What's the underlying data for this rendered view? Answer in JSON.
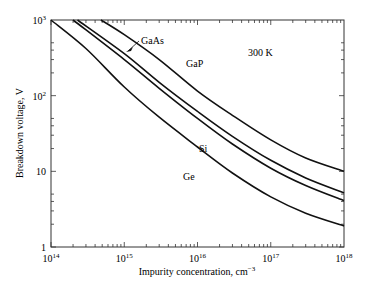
{
  "chart_data": {
    "type": "line",
    "title": "",
    "annotation": "300 K",
    "xlabel": "Impurity concentration, cm",
    "xlabel_unit_sup": "−3",
    "ylabel": "Breakdown voltage, V",
    "xscale": "log",
    "yscale": "log",
    "xlim": [
      100000000000000.0,
      1e+18
    ],
    "ylim": [
      1,
      1000
    ],
    "grid": false,
    "legend": "inline labels",
    "x_ticks": [
      {
        "base": "10",
        "exp": "14",
        "value": 100000000000000.0
      },
      {
        "base": "10",
        "exp": "15",
        "value": 1000000000000000.0
      },
      {
        "base": "10",
        "exp": "16",
        "value": 1e+16
      },
      {
        "base": "10",
        "exp": "17",
        "value": 1e+17
      },
      {
        "base": "10",
        "exp": "18",
        "value": 1e+18
      }
    ],
    "y_ticks": [
      {
        "label": "1",
        "exp": "",
        "value": 1
      },
      {
        "label": "10",
        "exp": "",
        "value": 10
      },
      {
        "label": "10",
        "exp": "2",
        "value": 100
      },
      {
        "label": "10",
        "exp": "3",
        "value": 1000
      }
    ],
    "x": [
      100000000000000.0,
      300000000000000.0,
      1000000000000000.0,
      3000000000000000.0,
      1e+16,
      3e+16,
      1e+17,
      3e+17,
      1e+18
    ],
    "series": [
      {
        "name": "GaP",
        "label_pos": [
          186,
          67
        ],
        "points": [
          [
            480000000000000.0,
            1000
          ],
          [
            1000000000000000.0,
            640
          ],
          [
            3000000000000000.0,
            300
          ],
          [
            1e+16,
            115
          ],
          [
            3e+16,
            55
          ],
          [
            1e+17,
            26
          ],
          [
            3e+17,
            15
          ],
          [
            1e+18,
            10
          ]
        ]
      },
      {
        "name": "GaAs",
        "label_pos": [
          141,
          44
        ],
        "arrow": true,
        "points": [
          [
            230000000000000.0,
            1000
          ],
          [
            1000000000000000.0,
            360
          ],
          [
            3000000000000000.0,
            150
          ],
          [
            1e+16,
            62
          ],
          [
            3e+16,
            29
          ],
          [
            1e+17,
            14
          ],
          [
            3e+17,
            8.2
          ],
          [
            1e+18,
            5.2
          ]
        ]
      },
      {
        "name": "Si",
        "label_pos": [
          199,
          152
        ],
        "points": [
          [
            200000000000000.0,
            1000
          ],
          [
            1000000000000000.0,
            300
          ],
          [
            3000000000000000.0,
            125
          ],
          [
            1e+16,
            50
          ],
          [
            3e+16,
            23
          ],
          [
            1e+17,
            11
          ],
          [
            3e+17,
            6.5
          ],
          [
            1e+18,
            4.1
          ]
        ]
      },
      {
        "name": "Ge",
        "label_pos": [
          183,
          180
        ],
        "points": [
          [
            100000000000000.0,
            1000
          ],
          [
            300000000000000.0,
            420
          ],
          [
            1000000000000000.0,
            130
          ],
          [
            3000000000000000.0,
            52
          ],
          [
            1e+16,
            21
          ],
          [
            3e+16,
            9.5
          ],
          [
            1e+17,
            4.6
          ],
          [
            3e+17,
            2.8
          ],
          [
            1e+18,
            1.9
          ]
        ]
      }
    ]
  }
}
